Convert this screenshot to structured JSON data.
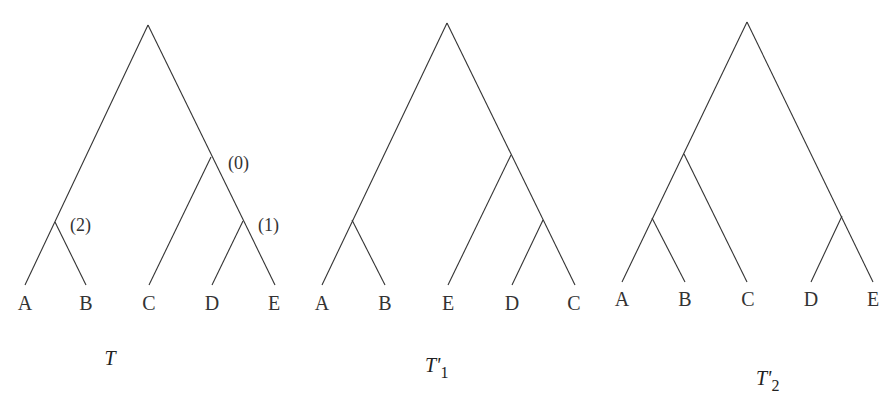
{
  "trees": [
    {
      "id": "T",
      "title": "T",
      "subscript": "",
      "leaves": [
        "A",
        "B",
        "C",
        "D",
        "E"
      ],
      "newick": "((A,B),(C,(D,E)))",
      "node_labels": [
        {
          "label": "(0)",
          "node": "(C,(D,E))"
        },
        {
          "label": "(1)",
          "node": "(D,E)"
        },
        {
          "label": "(2)",
          "node": "(A,B)"
        }
      ]
    },
    {
      "id": "T1",
      "title": "T'",
      "subscript": "1",
      "leaves": [
        "A",
        "B",
        "E",
        "D",
        "C"
      ],
      "newick": "((A,B),(E,(D,C)))",
      "node_labels": []
    },
    {
      "id": "T2",
      "title": "T'",
      "subscript": "2",
      "leaves": [
        "A",
        "B",
        "C",
        "D",
        "E"
      ],
      "newick": "(((A,B),C),(D,E))",
      "node_labels": []
    }
  ],
  "colors": {
    "line": "#333333",
    "text": "#333333",
    "background": "#ffffff"
  }
}
